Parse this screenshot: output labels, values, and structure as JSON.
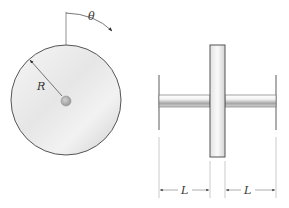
{
  "diagram": {
    "type": "mechanical-schematic",
    "labels": {
      "angle": "θ",
      "radius": "R",
      "left_length": "L",
      "right_length": "L"
    },
    "front_view": {
      "disk": {
        "cx": 66,
        "cy": 100,
        "r": 55
      },
      "hub": {
        "r": 5
      }
    },
    "side_view": {
      "rotor": {
        "x": 210,
        "y": 45,
        "width": 15,
        "height": 112
      },
      "shaft": {
        "x1": 159,
        "x2": 276,
        "y": 95,
        "height": 12
      },
      "left_wall_x": 159,
      "right_wall_x": 276
    },
    "colors": {
      "stroke": "#555555",
      "disk_light": "#f4f4f4",
      "disk_dark": "#c8c8c8",
      "hub": "#a8a8a8"
    }
  }
}
